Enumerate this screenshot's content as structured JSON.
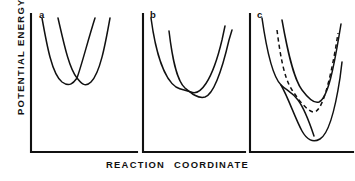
{
  "figure": {
    "axis_labels": {
      "y": "POTENTIAL ENERGY",
      "x_word_1": "REACTION",
      "x_word_2": "COORDINATE"
    },
    "panels": [
      {
        "label": "a",
        "description": "Two symmetric parabolas of equal depth crossing at a central cusp",
        "curves": [
          {
            "style": "solid",
            "path": "M 42 18 C 47 46, 52 74, 62 82 C 70 88, 74 82, 77 78 C 82 64, 88 40, 95 18"
          },
          {
            "style": "solid",
            "path": "M 58 18 C 64 44, 69 68, 77 78 C 81 83, 85 88, 91 82 C 100 73, 105 46, 110 18"
          }
        ]
      },
      {
        "label": "b",
        "description": "Asymmetric pair of parabolas; the right well is deeper and displaced to larger reaction coordinate",
        "curves": [
          {
            "style": "solid",
            "path": "M 151 18 C 155 48, 163 78, 176 87 C 181 90, 186 90, 191 92 C 200 96, 212 82, 222 40 L 225 26"
          },
          {
            "style": "solid",
            "path": "M 169 31 C 172 56, 176 80, 185 88 C 191 93, 198 99, 205 97 C 214 94, 222 70, 229 40 L 232 30"
          }
        ]
      },
      {
        "label": "c",
        "description": "Three curves: a shallow solid well, a dashed intermediate well, and a deep solid well at larger reaction coordinate",
        "curves": [
          {
            "style": "solid",
            "path": "M 262 18 C 266 46, 272 76, 281 85 C 286 90, 292 92, 298 100 C 304 108, 310 124, 314 136"
          },
          {
            "style": "dashed",
            "path": "M 277 30 C 280 54, 284 78, 292 90 C 298 99, 306 110, 313 112 C 322 114, 330 80, 336 46 L 338 33"
          },
          {
            "style": "solid",
            "path": "M 282 20 C 287 48, 293 78, 302 90 C 308 98, 314 104, 319 102 C 328 98, 334 66, 339 36 L 341 24"
          },
          {
            "style": "solid",
            "path": "M 281 85 C 288 97, 295 118, 302 131 C 307 140, 313 143, 320 139 C 330 133, 336 104, 340 78 L 342 62"
          }
        ]
      }
    ],
    "colors": {
      "ink": "#111111",
      "background": "#ffffff"
    }
  }
}
